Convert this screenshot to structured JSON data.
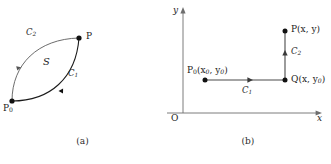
{
  "figure": {
    "background_color": "#ffffff",
    "ink_color": "#1a1a1a",
    "panel_a": {
      "caption": "(a)",
      "points": [
        {
          "name": "P0",
          "label": "P",
          "sub": "0",
          "x": 12,
          "y": 101
        },
        {
          "name": "P",
          "label": "P",
          "sub": "",
          "x": 79,
          "y": 38
        }
      ],
      "region_label": "S",
      "curves": [
        {
          "name": "C1",
          "label": "C",
          "sub": "1",
          "note": "lower-right arc from P0 to P, arrow mid-curve"
        },
        {
          "name": "C2",
          "label": "C",
          "sub": "2",
          "note": "upper-left arc from P0 to P, arrow mid-curve"
        }
      ],
      "labels": {
        "p0": "P",
        "p0_sub": "0",
        "p": "P",
        "s": "S",
        "c1": "C",
        "c1_sub": "1",
        "c2": "C",
        "c2_sub": "2"
      }
    },
    "panel_b": {
      "caption": "(b)",
      "axes": {
        "x_label": "x",
        "y_label": "y",
        "origin_label": "O"
      },
      "points": [
        {
          "name": "P0",
          "label": "P",
          "sub": "0",
          "coords": "(x",
          "coords_sub1": "0",
          "coords_mid": ", y",
          "coords_sub2": "0",
          "coords_end": ")"
        },
        {
          "name": "Q",
          "label": "Q",
          "coords": "(x, y",
          "coords_sub": "0",
          "coords_end": ")"
        },
        {
          "name": "P",
          "label": "P",
          "coords": "(x, y)"
        }
      ],
      "labels": {
        "p0_full": "P₀(x₀, y₀)",
        "q_full": "Q(x, y₀)",
        "p_full": "P(x, y)",
        "c1": "C",
        "c1_sub": "1",
        "c2": "C",
        "c2_sub": "2"
      },
      "segments": [
        {
          "name": "C1",
          "direction": "right",
          "note": "horizontal from P0 to Q"
        },
        {
          "name": "C2",
          "direction": "up",
          "note": "vertical from Q to P"
        }
      ]
    }
  }
}
